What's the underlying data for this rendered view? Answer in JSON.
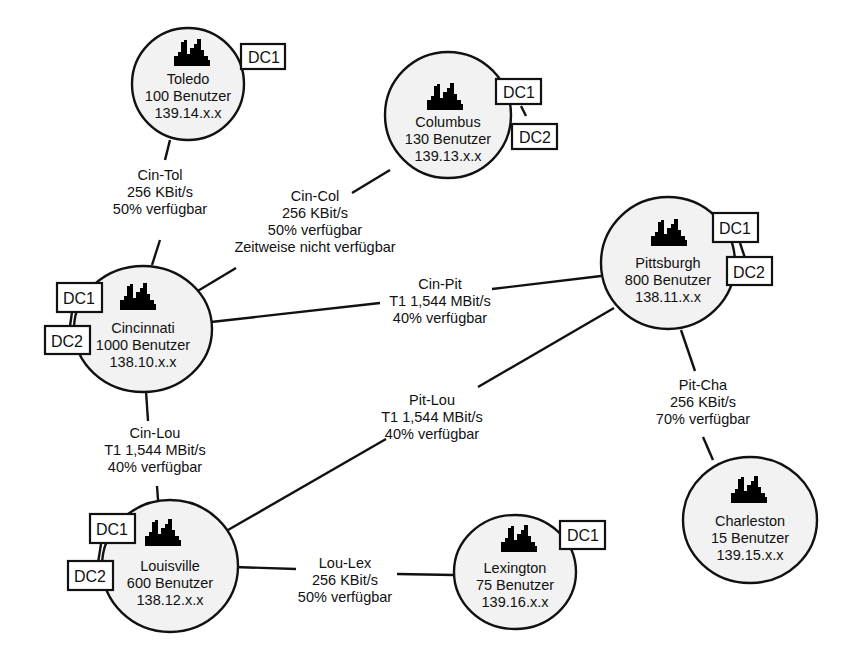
{
  "diagram": {
    "nodes": [
      {
        "id": "toledo",
        "name": "Toledo",
        "users": "100 Benutzer",
        "subnet": "139.14.x.x",
        "dcs": [
          "DC1"
        ]
      },
      {
        "id": "columbus",
        "name": "Columbus",
        "users": "130 Benutzer",
        "subnet": "139.13.x.x",
        "dcs": [
          "DC1",
          "DC2"
        ]
      },
      {
        "id": "cincinnati",
        "name": "Cincinnati",
        "users": "1000 Benutzer",
        "subnet": "138.10.x.x",
        "dcs": [
          "DC1",
          "DC2"
        ]
      },
      {
        "id": "pittsburgh",
        "name": "Pittsburgh",
        "users": "800 Benutzer",
        "subnet": "138.11.x.x",
        "dcs": [
          "DC1",
          "DC2"
        ]
      },
      {
        "id": "charleston",
        "name": "Charleston",
        "users": "15 Benutzer",
        "subnet": "139.15.x.x",
        "dcs": []
      },
      {
        "id": "louisville",
        "name": "Louisville",
        "users": "600 Benutzer",
        "subnet": "138.12.x.x",
        "dcs": [
          "DC1",
          "DC2"
        ]
      },
      {
        "id": "lexington",
        "name": "Lexington",
        "users": "75 Benutzer",
        "subnet": "139.16.x.x",
        "dcs": [
          "DC1"
        ]
      }
    ],
    "links": [
      {
        "id": "cin-tol",
        "name": "Cin-Tol",
        "bandwidth": "256 KBit/s",
        "availability": "50% verfügbar"
      },
      {
        "id": "cin-col",
        "name": "Cin-Col",
        "bandwidth": "256 KBit/s",
        "availability": "50% verfügbar",
        "note": "Zeitweise nicht verfügbar"
      },
      {
        "id": "cin-pit",
        "name": "Cin-Pit",
        "bandwidth": "T1 1,544 MBit/s",
        "availability": "40% verfügbar"
      },
      {
        "id": "pit-lou",
        "name": "Pit-Lou",
        "bandwidth": "T1 1,544 MBit/s",
        "availability": "40% verfügbar"
      },
      {
        "id": "pit-cha",
        "name": "Pit-Cha",
        "bandwidth": "256 KBit/s",
        "availability": "70% verfügbar"
      },
      {
        "id": "cin-lou",
        "name": "Cin-Lou",
        "bandwidth": "T1 1,544 MBit/s",
        "availability": "40% verfügbar"
      },
      {
        "id": "lou-lex",
        "name": "Lou-Lex",
        "bandwidth": "256 KBit/s",
        "availability": "50% verfügbar"
      }
    ],
    "icon": "city-skyline-icon",
    "colors": {
      "line": "#111111",
      "node_fill": "#f2f2f2",
      "icon_fill": "#8f8f8f",
      "background": "#ffffff"
    }
  }
}
